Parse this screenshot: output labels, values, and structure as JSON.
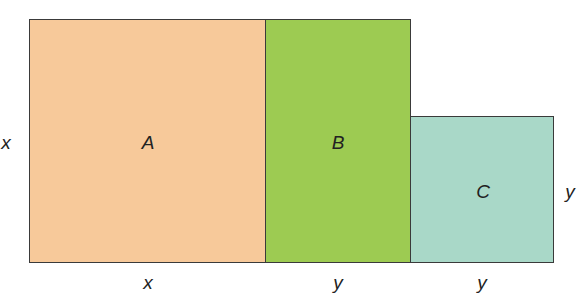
{
  "diagram": {
    "rects": [
      {
        "name": "A",
        "color": "#f7c99a",
        "width_label": "x",
        "height_label": "x"
      },
      {
        "name": "B",
        "color": "#9dcb52",
        "width_label": "y",
        "height_label": "x"
      },
      {
        "name": "C",
        "color": "#a9d8c8",
        "width_label": "y",
        "height_label": "y"
      }
    ],
    "labels": {
      "left_side": "x",
      "right_side": "y",
      "bottom_a": "x",
      "bottom_b": "y",
      "bottom_c": "y"
    }
  }
}
